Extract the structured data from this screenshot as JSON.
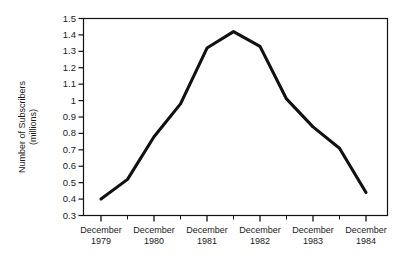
{
  "chart_data": {
    "type": "line",
    "title": "",
    "subtitle": "",
    "xlabel": "",
    "ylabel": "Number of Subscribers\n(millions)",
    "ylabel_line1": "Number of Subscribers",
    "ylabel_line2": "(millions)",
    "ylim": [
      0.3,
      1.5
    ],
    "ytick_labels": [
      "1.5",
      "1.4",
      "1.3",
      "1.2",
      "1.1",
      "1",
      "0.9",
      "0.8",
      "0.7",
      "0.6",
      "0.5",
      "0.4",
      "0.3"
    ],
    "ytick_values": [
      1.5,
      1.4,
      1.3,
      1.2,
      1.1,
      1.0,
      0.9,
      0.8,
      0.7,
      0.6,
      0.5,
      0.4,
      0.3
    ],
    "categories": [
      "December 1979",
      "December 1980",
      "December 1981",
      "December 1982",
      "December 1983",
      "December 1984"
    ],
    "xtick_labels": [
      {
        "month": "December",
        "year": "1979"
      },
      {
        "month": "December",
        "year": "1980"
      },
      {
        "month": "December",
        "year": "1981"
      },
      {
        "month": "December",
        "year": "1982"
      },
      {
        "month": "December",
        "year": "1983"
      },
      {
        "month": "December",
        "year": "1984"
      }
    ],
    "x_minor_ticks": [
      "June 1980",
      "June 1981",
      "June 1982",
      "June 1983",
      "June 1984"
    ],
    "grid": false,
    "legend": false,
    "legend_position": "none",
    "series": [
      {
        "name": "Number of Subscribers",
        "color": "#111111",
        "x": [
          "December 1979",
          "June 1980",
          "December 1980",
          "June 1981",
          "December 1981",
          "June 1982",
          "December 1982",
          "June 1983",
          "December 1983",
          "June 1984",
          "December 1984"
        ],
        "values": [
          0.4,
          0.52,
          0.78,
          0.98,
          1.32,
          1.42,
          1.33,
          1.01,
          0.84,
          0.71,
          0.44
        ]
      }
    ]
  },
  "axes": {
    "frame_color": "#111111",
    "tick_color": "#111111",
    "background": "#ffffff"
  }
}
